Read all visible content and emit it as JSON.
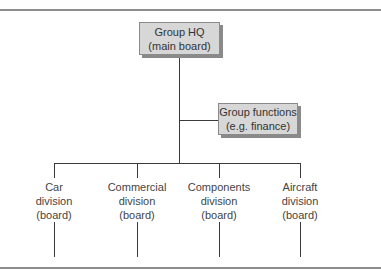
{
  "diagram": {
    "type": "organization-chart",
    "headquarters": {
      "line1": "Group HQ",
      "line2": "(main board)"
    },
    "functions": {
      "line1": "Group functions",
      "line2": "(e.g. finance)"
    },
    "divisions": [
      {
        "line1": "Car",
        "line2": "division",
        "line3": "(board)"
      },
      {
        "line1": "Commercial",
        "line2": "division",
        "line3": "(board)"
      },
      {
        "line1": "Components",
        "line2": "division",
        "line3": "(board)"
      },
      {
        "line1": "Aircraft",
        "line2": "division",
        "line3": "(board)"
      }
    ],
    "colors": {
      "box_fill": "#d7d7d7",
      "box_shadow": "#8a8a8a",
      "line": "#3a3a3a",
      "rule": "#8c8c8c"
    }
  }
}
